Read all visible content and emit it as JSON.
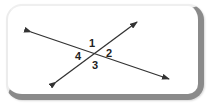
{
  "diagram": {
    "type": "intersecting-lines",
    "angle_labels": [
      "1",
      "2",
      "3",
      "4"
    ],
    "colors": {
      "line": "#333333",
      "frame_shadow": "#8a8a8a"
    }
  }
}
